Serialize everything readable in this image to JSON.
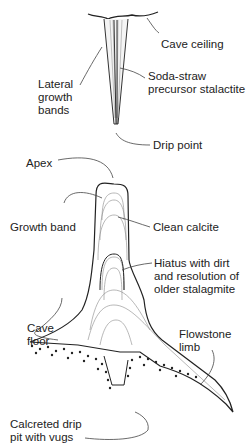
{
  "diagram": {
    "type": "labeled cross-section",
    "labels": {
      "cave_ceiling": "Cave ceiling",
      "lateral_growth_bands": "Lateral\ngrowth\nbands",
      "soda_straw": "Soda-straw\nprecursor stalactite",
      "drip_point": "Drip point",
      "apex": "Apex",
      "growth_band": "Growth band",
      "clean_calcite": "Clean calcite",
      "hiatus": "Hiatus with dirt\nand resolution of\nolder stalagmite",
      "cave_floor": "Cave\nfloor",
      "flowstone_limb": "Flowstone\nlimb",
      "drip_pit": "Calcreted drip\npit with vugs"
    },
    "colors": {
      "line": "#222222",
      "thin_line": "#777777",
      "text": "#222222"
    }
  }
}
